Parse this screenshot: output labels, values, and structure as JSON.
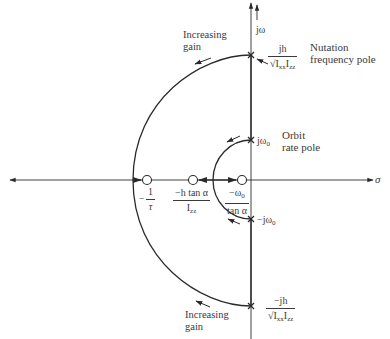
{
  "diagram": {
    "type": "root-locus",
    "axes": {
      "imag_label": "jω",
      "real_label": "σ"
    },
    "labels": {
      "increasing_gain_top": [
        "Increasing",
        "gain"
      ],
      "increasing_gain_bottom": [
        "Increasing",
        "gain"
      ],
      "nutation_pole": [
        "Nutation",
        "frequency pole"
      ],
      "orbit_pole": [
        "Orbit",
        "rate pole"
      ],
      "nutation_pos": {
        "num": "jh",
        "den": "√I",
        "den_sub1": "xx",
        "den_mid": "I",
        "den_sub2": "zz"
      },
      "nutation_neg": {
        "num": "−jh",
        "den": "√I",
        "den_sub1": "xx",
        "den_mid": "I",
        "den_sub2": "zz"
      },
      "orbit_pos": "jω",
      "orbit_pos_sub": "0",
      "orbit_neg": "−jω",
      "orbit_neg_sub": "0",
      "zero_tau": {
        "prefix": "−",
        "num": "1",
        "den": "τ"
      },
      "zero_h": {
        "num": "−h tan α",
        "den": "I",
        "den_sub": "zz"
      },
      "zero_omega": {
        "num": "−ω",
        "num_sub": "0",
        "den": "tan α"
      }
    },
    "colors": {
      "line": "#2a2a2a",
      "text": "#3a3a3a",
      "background": "#ffffff"
    }
  }
}
